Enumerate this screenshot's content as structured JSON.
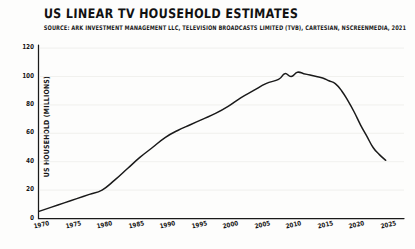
{
  "chart_data": {
    "type": "line",
    "title": "US LINEAR TV HOUSEHOLD ESTIMATES",
    "subtitle": "SOURCE: ARK INVESTMENT MANAGEMENT LLC, TELEVISION BROADCASTS LIMITED (TVB), CARTESIAN, NSCREENMEDIA, 2021",
    "xlabel": "",
    "ylabel": "US HOUSEHOLD (MILLIONS)",
    "xlim": [
      1970,
      2026
    ],
    "ylim": [
      0,
      125
    ],
    "grid": "horizontal-faint",
    "legend": "none",
    "style": "hand-drawn-sketch",
    "line_color": "#1a1a1a",
    "x_ticks": [
      1970,
      1975,
      1980,
      1985,
      1990,
      1995,
      2000,
      2005,
      2010,
      2015,
      2020,
      2025
    ],
    "y_ticks": [
      0,
      20,
      40,
      60,
      80,
      100,
      120
    ],
    "series": [
      {
        "name": "US Linear TV Households",
        "x": [
          1970,
          1972,
          1974,
          1976,
          1978,
          1980,
          1982,
          1984,
          1986,
          1988,
          1990,
          1992,
          1994,
          1996,
          1998,
          2000,
          2002,
          2004,
          2006,
          2008,
          2009,
          2010,
          2011,
          2012,
          2013,
          2014,
          2015,
          2016,
          2017,
          2018,
          2019,
          2020,
          2021,
          2022,
          2023,
          2024,
          2025
        ],
        "values": [
          5,
          8,
          11,
          14,
          17,
          20,
          27,
          35,
          43,
          50,
          57,
          62,
          66,
          70,
          74,
          79,
          85,
          90,
          95,
          98,
          102,
          100,
          103,
          102,
          101,
          100,
          99,
          97,
          95,
          90,
          83,
          75,
          66,
          58,
          50,
          45,
          41
        ]
      }
    ],
    "annotations": {
      "peak_value": 103,
      "peak_year": 2011,
      "start_value": 5,
      "end_value": 41
    }
  },
  "axes": {
    "y_tick_labels": [
      "120",
      "100",
      "80",
      "60",
      "40",
      "20",
      "0"
    ],
    "x_tick_labels": [
      "1970",
      "1975",
      "1980",
      "1985",
      "1990",
      "1995",
      "2000",
      "2005",
      "2010",
      "2015",
      "2020",
      "2025"
    ]
  }
}
